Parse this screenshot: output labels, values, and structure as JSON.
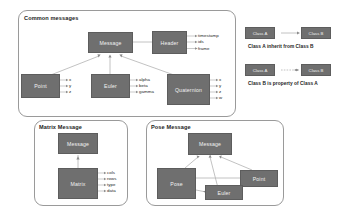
{
  "diagram": {
    "title_hidden": "",
    "panels": [
      {
        "id": "common",
        "title": "Common messages",
        "nodes": [
          {
            "id": "msg",
            "label": "Message"
          },
          {
            "id": "header",
            "label": "Header"
          },
          {
            "id": "point",
            "label": "Point"
          },
          {
            "id": "euler",
            "label": "Euler"
          },
          {
            "id": "quaternion",
            "label": "Quaternion"
          }
        ],
        "attributes": {
          "header": [
            "timestamp",
            "ids",
            "frame"
          ],
          "point": [
            "x",
            "y",
            "z"
          ],
          "euler": [
            "alpha",
            "beta",
            "gamma"
          ],
          "quaternion": [
            "x",
            "y",
            "z",
            "w"
          ]
        }
      },
      {
        "id": "matrix",
        "title": "Matrix Message",
        "nodes": [
          {
            "id": "msg",
            "label": "Message"
          },
          {
            "id": "matrix",
            "label": "Matrix"
          }
        ],
        "attributes": {
          "matrix": [
            "cols",
            "rows",
            "type",
            "data"
          ]
        }
      },
      {
        "id": "pose",
        "title": "Pose Message",
        "nodes": [
          {
            "id": "msg",
            "label": "Message"
          },
          {
            "id": "pose",
            "label": "Pose"
          },
          {
            "id": "point",
            "label": "Point"
          },
          {
            "id": "euler",
            "label": "Euler"
          }
        ],
        "attributes": {}
      }
    ],
    "legend": [
      {
        "left_label": "Class A",
        "right_label": "Class B",
        "caption": "Class A inherit from Class B"
      },
      {
        "left_label": "Class A",
        "right_label": "Class B",
        "caption": "Class B is property of Class A"
      }
    ],
    "colors": {
      "node_fill": "#6f6f6f",
      "node_text": "#f2f2f2",
      "panel_border": "#9a9a9a",
      "wire": "#b3b3b3",
      "text": "#1d1d1d"
    }
  }
}
